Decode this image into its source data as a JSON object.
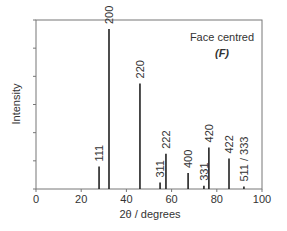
{
  "chart_data": {
    "type": "bar",
    "title": "",
    "annotation": "Face centred",
    "annotation_symbol": "(F)",
    "xlabel": "2θ / degrees",
    "ylabel": "Intensity",
    "xlim": [
      0,
      100
    ],
    "ylim": [
      0,
      100
    ],
    "xticks": [
      0,
      20,
      40,
      60,
      80,
      100
    ],
    "y_tick_count": 7,
    "y_tick_labels": false,
    "grid": false,
    "legend": null,
    "peaks": [
      {
        "label": "111",
        "x": 27.9,
        "y": 14
      },
      {
        "label": "200",
        "x": 32.3,
        "y": 100
      },
      {
        "label": "220",
        "x": 46.0,
        "y": 66
      },
      {
        "label": "311",
        "x": 54.9,
        "y": 4
      },
      {
        "label": "222",
        "x": 57.5,
        "y": 22
      },
      {
        "label": "400",
        "x": 67.3,
        "y": 10
      },
      {
        "label": "331",
        "x": 74.3,
        "y": 2
      },
      {
        "label": "420",
        "x": 76.5,
        "y": 26
      },
      {
        "label": "422",
        "x": 85.4,
        "y": 19
      },
      {
        "label": "511 / 333",
        "x": 92.0,
        "y": 1.5
      }
    ]
  },
  "colors": {
    "axis": "#777777",
    "bars": "#222222",
    "text": "#333333"
  }
}
